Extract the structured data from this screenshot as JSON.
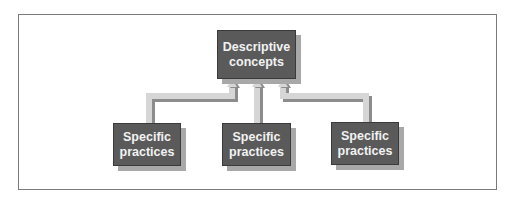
{
  "diagram": {
    "top_node": {
      "label_line1": "Descriptive",
      "label_line2": "concepts"
    },
    "bottom_nodes": [
      {
        "label_line1": "Specific",
        "label_line2": "practices"
      },
      {
        "label_line1": "Specific",
        "label_line2": "practices"
      },
      {
        "label_line1": "Specific",
        "label_line2": "practices"
      }
    ],
    "colors": {
      "box_fill": "#5a5a5a",
      "box_shadow": "#a8a8a8",
      "arrow_light": "#d0d0d0",
      "arrow_dark": "#8c8c8c",
      "frame_border": "#7a7a7a"
    }
  }
}
